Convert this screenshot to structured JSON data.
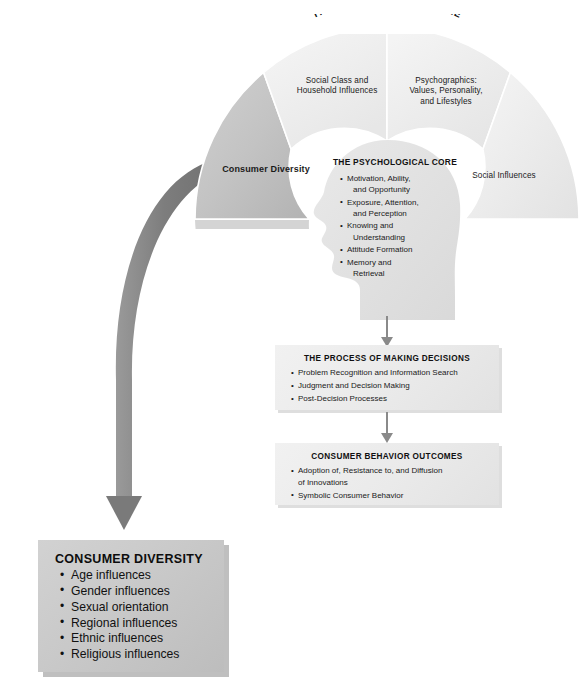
{
  "figure": {
    "title": "THE CONSUMER'S CULTURE"
  },
  "wheel": {
    "segments": [
      {
        "id": "consumer-diversity",
        "label": "Consumer Diversity",
        "highlighted": true
      },
      {
        "id": "social-class",
        "line1": "Social Class and",
        "line2": "Household Influences"
      },
      {
        "id": "psychographics",
        "line1": "Psychographics:",
        "line2": "Values, Personality,",
        "line3": "and Lifestyles"
      },
      {
        "id": "social-influences",
        "label": "Social Influences"
      }
    ]
  },
  "core": {
    "title": "THE PSYCHOLOGICAL CORE",
    "items": [
      "Motivation, Ability, and Opportunity",
      "Exposure, Attention, and Perception",
      "Knowing and Understanding",
      "Attitude Formation",
      "Memory and Retrieval"
    ],
    "items_wrapped": [
      [
        "Motivation, Ability,",
        "and Opportunity"
      ],
      [
        "Exposure, Attention,",
        "and Perception"
      ],
      [
        "Knowing and",
        "Understanding"
      ],
      [
        "Attitude Formation"
      ],
      [
        "Memory and",
        "Retrieval"
      ]
    ]
  },
  "process_box": {
    "title": "THE PROCESS OF MAKING DECISIONS",
    "items": [
      "Problem Recognition and Information Search",
      "Judgment and Decision Making",
      "Post-Decision Processes"
    ]
  },
  "outcomes_box": {
    "title": "CONSUMER BEHAVIOR OUTCOMES",
    "items": [
      "Adoption of, Resistance to, and Diffusion of Innovations",
      "Symbolic Consumer Behavior"
    ],
    "items_wrapped": [
      [
        "Adoption of, Resistance to, and Diffusion",
        "of Innovations"
      ],
      [
        "Symbolic Consumer Behavior"
      ]
    ]
  },
  "diversity_box": {
    "title": "CONSUMER DIVERSITY",
    "items": [
      "Age influences",
      "Gender influences",
      "Sexual orientation",
      "Regional influences",
      "Ethnic influences",
      "Religious influences"
    ]
  },
  "colors": {
    "page_background": "#ffffff",
    "wedge_light": "#f0f0f0",
    "wedge_highlight": "#bfbfbf",
    "head_fill": "#e3e3e3",
    "box_fill": "#ececec",
    "diversity_box_fill": "#c8c8c8",
    "arrow_gray": "#808080",
    "text": "#1a1a1a"
  }
}
